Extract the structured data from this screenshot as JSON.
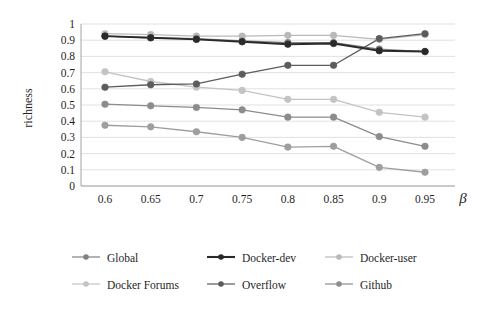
{
  "chart_data": {
    "type": "line",
    "title": "",
    "xlabel": "β",
    "ylabel": "richness",
    "x": [
      0.6,
      0.65,
      0.7,
      0.75,
      0.8,
      0.85,
      0.9,
      0.95
    ],
    "xtick_labels": [
      "0.6",
      "0.65",
      "0.7",
      "0.75",
      "0.8",
      "0.85",
      "0.9",
      "0.95"
    ],
    "ytick_labels": [
      "0",
      "0.1",
      "0.2",
      "0.3",
      "0.4",
      "0.5",
      "0.6",
      "0.7",
      "0.8",
      "0.9",
      "1"
    ],
    "ylim": [
      0,
      1
    ],
    "grid": true,
    "legend_position": "bottom",
    "series": [
      {
        "name": "Global",
        "color": "#808080",
        "values": [
          0.925,
          0.915,
          0.91,
          0.895,
          0.885,
          0.885,
          0.845,
          0.83
        ]
      },
      {
        "name": "Docker-dev",
        "color": "#2a2a2a",
        "values": [
          0.925,
          0.915,
          0.905,
          0.89,
          0.875,
          0.88,
          0.835,
          0.83
        ]
      },
      {
        "name": "Docker-user",
        "color": "#b9b9b9",
        "values": [
          0.94,
          0.935,
          0.925,
          0.925,
          0.93,
          0.93,
          0.905,
          0.935
        ]
      },
      {
        "name": "Docker Forums",
        "color": "#c3c3c3",
        "values": [
          0.705,
          0.645,
          0.61,
          0.59,
          0.535,
          0.535,
          0.455,
          0.425
        ]
      },
      {
        "name": "Overflow",
        "color": "#5c5c5c",
        "values": [
          0.61,
          0.625,
          0.63,
          0.69,
          0.745,
          0.745,
          0.91,
          0.94
        ]
      },
      {
        "name": "Github",
        "color": "#8c8c8c",
        "values": [
          0.505,
          0.495,
          0.485,
          0.47,
          0.425,
          0.425,
          0.305,
          0.245
        ]
      },
      {
        "name": "Github-low",
        "color": "#9e9e9e",
        "values": [
          0.375,
          0.365,
          0.335,
          0.3,
          0.24,
          0.245,
          0.115,
          0.085
        ]
      }
    ],
    "legend": [
      {
        "label": "Global",
        "color": "#808080",
        "weight": "normal"
      },
      {
        "label": "Docker-dev",
        "color": "#2a2a2a",
        "weight": "bold"
      },
      {
        "label": "Docker-user",
        "color": "#b9b9b9",
        "weight": "normal"
      },
      {
        "label": "Docker Forums",
        "color": "#c3c3c3",
        "weight": "normal"
      },
      {
        "label": "Overflow",
        "color": "#5c5c5c",
        "weight": "normal"
      },
      {
        "label": "Github",
        "color": "#8c8c8c",
        "weight": "normal"
      }
    ]
  },
  "axes": {
    "y_title": "richness",
    "x_title": "β"
  }
}
